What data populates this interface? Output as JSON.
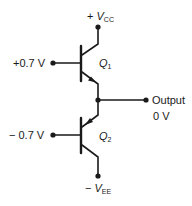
{
  "diagram": {
    "type": "circuit-schematic",
    "supply_top": {
      "sign": "+",
      "symbol": "V",
      "subscript": "CC"
    },
    "supply_bottom": {
      "sign": "−",
      "symbol": "V",
      "subscript": "EE"
    },
    "transistors": [
      {
        "id": "Q",
        "subscript": "1",
        "type": "NPN",
        "base_input": "+0.7 V"
      },
      {
        "id": "Q",
        "subscript": "2",
        "type": "PNP",
        "base_input": "− 0.7 V"
      }
    ],
    "output": {
      "label": "Output",
      "value": "0 V"
    },
    "colors": {
      "stroke": "#1a1a1a",
      "background": "#ffffff"
    }
  }
}
